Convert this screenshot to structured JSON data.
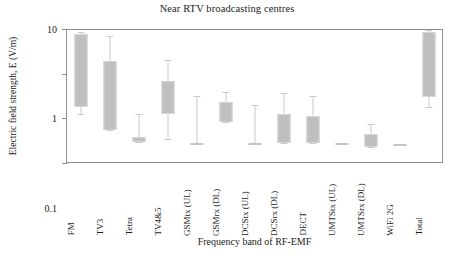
{
  "chart_data": {
    "type": "box",
    "title": "Near RTV broadcasting centres",
    "xlabel": "Frequency band of RF-EMF",
    "ylabel": "Electric field strength, E (V/m)",
    "yscale": "log",
    "ylim": [
      0.01,
      10
    ],
    "ytick_labels": [
      "10",
      "1",
      "0.1",
      "0.01"
    ],
    "ytick_values": [
      10,
      1,
      0.1,
      0.01
    ],
    "grid": false,
    "legend": "none",
    "series_color": "#bfbfbf",
    "categories": [
      "FM",
      "TV3",
      "Tetra",
      "TV4&5",
      "GSMtx (UL)",
      "GSMrx (DL)",
      "DCStx (UL)",
      "DCSrx (DL)",
      "DECT",
      "UMTStx (UL)",
      "UMTSrx (DL)",
      "WiFi 2G",
      "Total"
    ],
    "boxes": [
      {
        "category": "FM",
        "whisker_low": 0.125,
        "q1": 0.18,
        "q3": 7.6,
        "whisker_high": 8.7
      },
      {
        "category": "TV3",
        "whisker_low": 0.055,
        "q1": 0.055,
        "q3": 1.9,
        "whisker_high": 7.0
      },
      {
        "category": "Tetra",
        "whisker_low": 0.03,
        "q1": 0.03,
        "q3": 0.038,
        "whisker_high": 0.125
      },
      {
        "category": "TV4&5",
        "whisker_low": 0.035,
        "q1": 0.125,
        "q3": 0.67,
        "whisker_high": 2.0
      },
      {
        "category": "GSMtx (UL)",
        "whisker_low": 0.028,
        "q1": 0.028,
        "q3": 0.028,
        "whisker_high": 0.32
      },
      {
        "category": "GSMrx (DL)",
        "whisker_low": 0.083,
        "q1": 0.083,
        "q3": 0.23,
        "whisker_high": 0.39
      },
      {
        "category": "DCStx (UL)",
        "whisker_low": 0.028,
        "q1": 0.028,
        "q3": 0.028,
        "whisker_high": 0.2
      },
      {
        "category": "DCSrx (DL)",
        "whisker_low": 0.028,
        "q1": 0.028,
        "q3": 0.125,
        "whisker_high": 0.36
      },
      {
        "category": "DECT",
        "whisker_low": 0.028,
        "q1": 0.028,
        "q3": 0.115,
        "whisker_high": 0.31
      },
      {
        "category": "UMTStx (UL)",
        "whisker_low": 0.028,
        "q1": 0.028,
        "q3": 0.028,
        "whisker_high": 0.028
      },
      {
        "category": "UMTSrx (DL)",
        "whisker_low": 0.023,
        "q1": 0.023,
        "q3": 0.045,
        "whisker_high": 0.075
      },
      {
        "category": "WiFi 2G",
        "whisker_low": 0.026,
        "q1": 0.026,
        "q3": 0.026,
        "whisker_high": 0.026
      },
      {
        "category": "Total",
        "whisker_low": 0.18,
        "q1": 0.3,
        "q3": 8.5,
        "whisker_high": 9.6
      }
    ]
  }
}
